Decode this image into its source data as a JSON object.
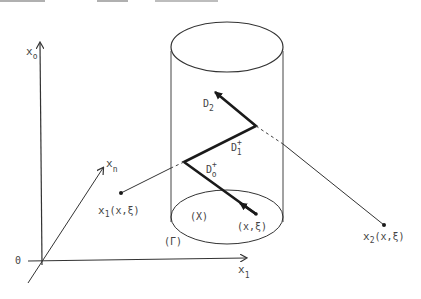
{
  "colors": {
    "ink": "#333333",
    "path": "#1a1a1a",
    "text": "#444444",
    "residue": "#aaaaaa"
  },
  "axes": {
    "vertical": {
      "base": "x",
      "sub": "o"
    },
    "depth": {
      "base": "x",
      "sub": "n"
    },
    "horizontal": {
      "base": "x",
      "sub": "1"
    },
    "origin": "0"
  },
  "cylinder": {
    "boundary_label": "(Γ)",
    "domain_label": "(X)"
  },
  "path": {
    "segments": [
      {
        "base": "D",
        "sub": "2",
        "sup": ""
      },
      {
        "base": "D",
        "sub": "1",
        "sup": "+"
      },
      {
        "base": "D",
        "sub": "o",
        "sup": "+"
      }
    ],
    "start_label": "(x,ξ)"
  },
  "points": [
    {
      "base": "x",
      "sub": "1",
      "arg": "(x,ξ)"
    },
    {
      "base": "x",
      "sub": "2",
      "arg": "(x,ξ)"
    }
  ]
}
